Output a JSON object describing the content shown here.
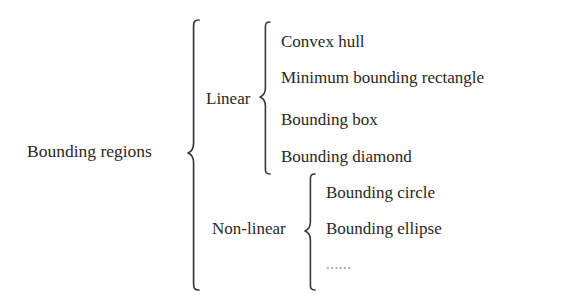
{
  "figure": {
    "type": "hierarchy-tree",
    "orientation": "left-to-right",
    "connector": "curly-brace",
    "background_color": "#fefefe",
    "text_color": "#2b2724",
    "brace_color": "#3b3836"
  },
  "root": {
    "label": "Bounding regions"
  },
  "branches": [
    {
      "label": "Linear",
      "items": [
        {
          "label": "Convex hull"
        },
        {
          "label": "Minimum bounding rectangle"
        },
        {
          "label": "Bounding box"
        },
        {
          "label": "Bounding diamond"
        }
      ]
    },
    {
      "label": "Non-linear",
      "items": [
        {
          "label": "Bounding circle"
        },
        {
          "label": "Bounding ellipse"
        },
        {
          "label": "......"
        }
      ]
    }
  ]
}
